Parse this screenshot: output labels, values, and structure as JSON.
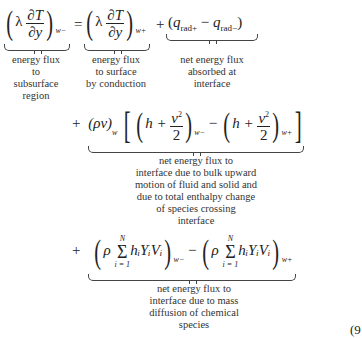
{
  "equation": {
    "row1": {
      "lhs": {
        "lambda": "λ",
        "numerator": "∂T",
        "denominator": "∂y",
        "subscript": "w−"
      },
      "equals": "=",
      "term1": {
        "lambda": "λ",
        "numerator": "∂T",
        "denominator": "∂y",
        "subscript": "w+"
      },
      "plus": "+",
      "term2": {
        "q1": "q",
        "q1_sub": "rad+",
        "minus": "−",
        "q2": "q",
        "q2_sub": "rad−"
      }
    },
    "row2": {
      "plus": "+",
      "rho_v": "(ρv)",
      "rho_v_sub": "w",
      "h1": "h +",
      "v2_num": "v",
      "v2_sup": "2",
      "v2_den": "2",
      "sub1": "w−",
      "minus": "−",
      "h2": "h +",
      "sub2": "w+"
    },
    "row3": {
      "plus": "+",
      "rho": "ρ",
      "sum_top": "N",
      "sum_symbol": "Σ",
      "sum_bottom": "i = 1",
      "term": "hᵢYᵢVᵢ",
      "sub1": "w−",
      "minus": "−",
      "sub2": "w+"
    },
    "equation_number": "(9"
  },
  "annotations": {
    "lhs": [
      "energy flux",
      "to",
      "subsurface",
      "region"
    ],
    "conduction": [
      "energy flux",
      "to surface",
      "by conduction"
    ],
    "radiation": [
      "net energy flux",
      "absorbed at",
      "interface"
    ],
    "bulk": [
      "net energy flux to",
      "interface due to bulk upward",
      "motion of fluid and solid and",
      "due to total enthalpy change",
      "of species crossing",
      "interface"
    ],
    "diffusion": [
      "net energy flux to",
      "interface due to mass",
      "diffusion of chemical",
      "species"
    ]
  }
}
